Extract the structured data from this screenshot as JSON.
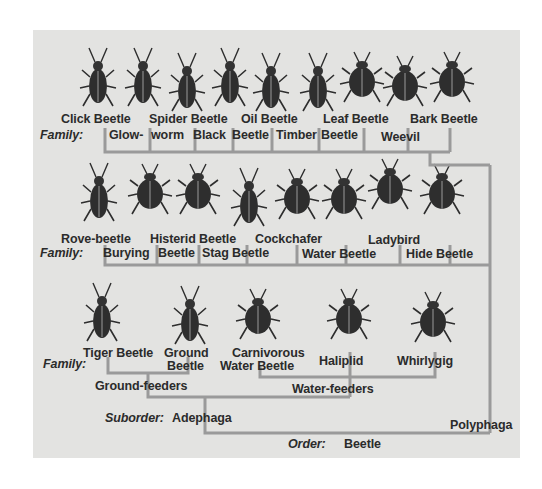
{
  "diagram": {
    "colors": {
      "panel": "#e3e3e1",
      "lines": "#9a9a9a",
      "text": "#2b2b2b",
      "beetle": "#2e2e2e"
    },
    "row1": {
      "label": "Family:",
      "families": [
        {
          "name": "Click Beetle"
        },
        {
          "name": "Glow-worm"
        },
        {
          "name": "Spider Beetle"
        },
        {
          "name": "Black Beetle"
        },
        {
          "name": "Oil Beetle"
        },
        {
          "name": "Timber Beetle"
        },
        {
          "name": "Leaf Beetle"
        },
        {
          "name": "Weevil"
        },
        {
          "name": "Bark Beetle"
        }
      ],
      "labels": {
        "click": "Click Beetle",
        "spider": "Spider Beetle",
        "oil": "Oil Beetle",
        "leaf": "Leaf Beetle",
        "bark": "Bark Beetle",
        "glow": "Glow-",
        "worm": "worm",
        "black": "Black",
        "black2": "Beetle",
        "timber": "Timber",
        "timber2": "Beetle",
        "weevil": "Weevil"
      }
    },
    "row2": {
      "label": "Family:",
      "families": [
        {
          "name": "Rove-beetle"
        },
        {
          "name": "Burying Beetle"
        },
        {
          "name": "Histerid Beetle"
        },
        {
          "name": "Stag Beetle"
        },
        {
          "name": "Cockchafer"
        },
        {
          "name": "Water Beetle"
        },
        {
          "name": "Ladybird"
        },
        {
          "name": "Hide Beetle"
        }
      ],
      "labels": {
        "rove": "Rove-beetle",
        "histerid": "Histerid Beetle",
        "cockchafer": "Cockchafer",
        "ladybird": "Ladybird",
        "burying": "Burying",
        "burying2": "Beetle",
        "stag": "Stag Beetle",
        "water": "Water Beetle",
        "hide": "Hide Beetle"
      }
    },
    "row3": {
      "label": "Family:",
      "families": [
        {
          "name": "Tiger Beetle"
        },
        {
          "name": "Ground Beetle"
        },
        {
          "name": "Carnivorous Water Beetle"
        },
        {
          "name": "Haliplid"
        },
        {
          "name": "Whirlygig"
        }
      ],
      "labels": {
        "tiger": "Tiger Beetle",
        "ground1": "Ground",
        "ground2": "Beetle",
        "carn1": "Carnivorous",
        "carn2": "Water Beetle",
        "haliplid": "Haliplid",
        "whirlygig": "Whirlygig"
      }
    },
    "groups": {
      "ground_feeders": "Ground-feeders",
      "water_feeders": "Water-feeders"
    },
    "suborder": {
      "label": "Suborder:",
      "adephaga": "Adephaga",
      "polyphaga": "Polyphaga"
    },
    "order": {
      "label": "Order:",
      "name": "Beetle"
    }
  }
}
